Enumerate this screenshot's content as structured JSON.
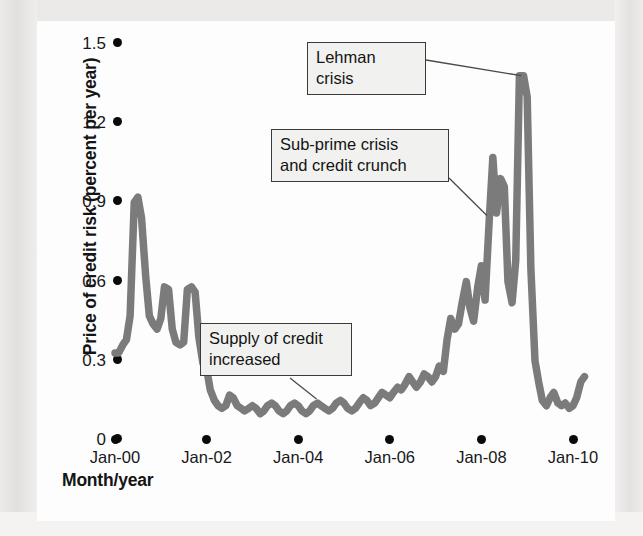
{
  "figure": {
    "y_axis_title": "Price of credit risk (percent per year)",
    "x_axis_title": "Month/year"
  },
  "chart_data": {
    "type": "line",
    "title": "",
    "xlabel": "Month/year",
    "ylabel": "Price of credit risk (percent per year)",
    "xlim": [
      "Jan-00",
      "Jan-10"
    ],
    "ylim": [
      0,
      1.5
    ],
    "yticks": [
      "0",
      "0.3",
      "0.6",
      "0.9",
      "1.2",
      "1.5"
    ],
    "ytick_values": [
      0,
      0.3,
      0.6,
      0.9,
      1.2,
      1.5
    ],
    "xticks": [
      "Jan-00",
      "Jan-02",
      "Jan-04",
      "Jan-06",
      "Jan-08",
      "Jan-10"
    ],
    "xtick_values": [
      2000.0,
      2002.0,
      2004.0,
      2006.0,
      2008.0,
      2010.0
    ],
    "grid": false,
    "legend": "none",
    "line_color": "#7b7b7b",
    "series": [
      {
        "name": "Price of credit risk",
        "x": [
          2000.0,
          2000.08,
          2000.17,
          2000.25,
          2000.33,
          2000.42,
          2000.5,
          2000.58,
          2000.67,
          2000.75,
          2000.83,
          2000.92,
          2001.0,
          2001.08,
          2001.17,
          2001.25,
          2001.33,
          2001.42,
          2001.5,
          2001.58,
          2001.67,
          2001.75,
          2001.83,
          2001.92,
          2002.0,
          2002.08,
          2002.17,
          2002.25,
          2002.33,
          2002.42,
          2002.5,
          2002.58,
          2002.67,
          2002.75,
          2002.83,
          2002.92,
          2003.0,
          2003.08,
          2003.17,
          2003.25,
          2003.33,
          2003.42,
          2003.5,
          2003.58,
          2003.67,
          2003.75,
          2003.83,
          2003.92,
          2004.0,
          2004.08,
          2004.17,
          2004.25,
          2004.33,
          2004.42,
          2004.5,
          2004.58,
          2004.67,
          2004.75,
          2004.83,
          2004.92,
          2005.0,
          2005.08,
          2005.17,
          2005.25,
          2005.33,
          2005.42,
          2005.5,
          2005.58,
          2005.67,
          2005.75,
          2005.83,
          2005.92,
          2006.0,
          2006.08,
          2006.17,
          2006.25,
          2006.33,
          2006.42,
          2006.5,
          2006.58,
          2006.67,
          2006.75,
          2006.83,
          2006.92,
          2007.0,
          2007.08,
          2007.17,
          2007.25,
          2007.33,
          2007.42,
          2007.5,
          2007.58,
          2007.67,
          2007.75,
          2007.83,
          2007.92,
          2008.0,
          2008.08,
          2008.17,
          2008.25,
          2008.33,
          2008.42,
          2008.5,
          2008.58,
          2008.67,
          2008.75,
          2008.83,
          2008.92,
          2009.0,
          2009.08,
          2009.17,
          2009.25,
          2009.33,
          2009.42,
          2009.5,
          2009.58,
          2009.67,
          2009.75,
          2009.83,
          2009.92,
          2010.0,
          2010.08,
          2010.17,
          2010.25
        ],
        "values": [
          0.33,
          0.33,
          0.36,
          0.38,
          0.47,
          0.9,
          0.92,
          0.84,
          0.62,
          0.47,
          0.44,
          0.42,
          0.46,
          0.58,
          0.57,
          0.42,
          0.37,
          0.36,
          0.37,
          0.57,
          0.58,
          0.56,
          0.39,
          0.29,
          0.27,
          0.19,
          0.15,
          0.13,
          0.12,
          0.13,
          0.17,
          0.16,
          0.13,
          0.12,
          0.11,
          0.12,
          0.13,
          0.12,
          0.1,
          0.11,
          0.13,
          0.14,
          0.13,
          0.11,
          0.1,
          0.11,
          0.13,
          0.14,
          0.13,
          0.11,
          0.1,
          0.11,
          0.13,
          0.14,
          0.13,
          0.12,
          0.11,
          0.12,
          0.14,
          0.15,
          0.14,
          0.12,
          0.11,
          0.12,
          0.14,
          0.16,
          0.15,
          0.13,
          0.14,
          0.16,
          0.18,
          0.17,
          0.16,
          0.18,
          0.2,
          0.19,
          0.21,
          0.24,
          0.22,
          0.2,
          0.22,
          0.25,
          0.24,
          0.22,
          0.24,
          0.28,
          0.26,
          0.38,
          0.46,
          0.42,
          0.44,
          0.52,
          0.6,
          0.5,
          0.45,
          0.58,
          0.66,
          0.53,
          0.83,
          1.07,
          0.86,
          0.99,
          0.96,
          0.6,
          0.52,
          0.68,
          1.38,
          1.38,
          1.3,
          0.65,
          0.3,
          0.22,
          0.15,
          0.13,
          0.16,
          0.18,
          0.14,
          0.13,
          0.14,
          0.12,
          0.13,
          0.16,
          0.22,
          0.24
        ],
        "color": "#7b7b7b"
      }
    ],
    "annotations": [
      {
        "id": "lehman",
        "label": "Lehman crisis",
        "points_to_x": 2008.87,
        "points_to_y": 1.38
      },
      {
        "id": "subprime",
        "label": "Sub-prime crisis\nand credit crunch",
        "points_to_x": 2008.25,
        "points_to_y": 1.07
      },
      {
        "id": "supply",
        "label": "Supply of credit\nincreased",
        "points_to_x": 2004.4,
        "points_to_y": 0.14
      }
    ]
  },
  "yticks_render": [
    {
      "label": "1.5",
      "value": 1.5
    },
    {
      "label": "1.2",
      "value": 1.2
    },
    {
      "label": "0.9",
      "value": 0.9
    },
    {
      "label": "0.6",
      "value": 0.6
    },
    {
      "label": "0.3",
      "value": 0.3
    },
    {
      "label": "0",
      "value": 0
    }
  ],
  "xticks_render": [
    {
      "label": "Jan-00",
      "value": 2000
    },
    {
      "label": "Jan-02",
      "value": 2002
    },
    {
      "label": "Jan-04",
      "value": 2004
    },
    {
      "label": "Jan-06",
      "value": 2006
    },
    {
      "label": "Jan-08",
      "value": 2008
    },
    {
      "label": "Jan-10",
      "value": 2010
    }
  ]
}
